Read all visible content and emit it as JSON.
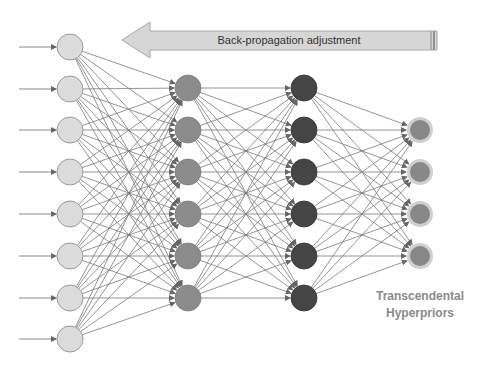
{
  "diagram": {
    "title_arrow": {
      "label": "Back-propagation adjustment",
      "direction": "left",
      "fill": "#d6d6d6",
      "stroke": "#a8a8a8"
    },
    "output_caption": {
      "line1": "Transcendental",
      "line2": "Hyperpriors",
      "color": "#8a8a8a"
    },
    "colors": {
      "edge": "#7a7a7a",
      "input_fill": "#dcdcdc",
      "input_stroke": "#9a9a9a",
      "hidden1_fill": "#8c8c8c",
      "hidden2_fill": "#454545",
      "output_fill": "#888888",
      "output_halo": "#cfcfcf"
    },
    "layers": [
      {
        "name": "input",
        "x": 70,
        "nodes": [
          47,
          89,
          130,
          172,
          214,
          256,
          298,
          339
        ]
      },
      {
        "name": "hidden-1",
        "x": 188,
        "nodes": [
          88,
          130,
          172,
          214,
          256,
          298
        ]
      },
      {
        "name": "hidden-2",
        "x": 304,
        "nodes": [
          88,
          130,
          172,
          214,
          256,
          298
        ]
      },
      {
        "name": "output",
        "x": 420,
        "nodes": [
          130,
          172,
          214,
          256
        ]
      }
    ],
    "node_radius": 13,
    "input_arrow_start_x": 19
  }
}
